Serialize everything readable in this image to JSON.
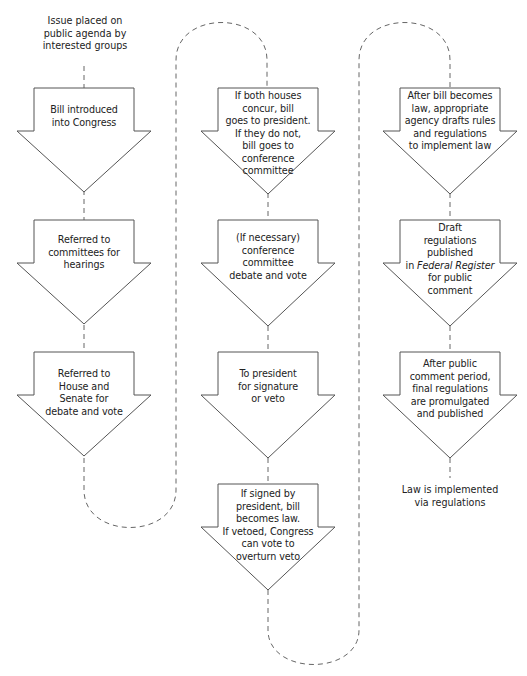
{
  "start_label": [
    "Issue placed on",
    "public agenda by",
    "interested groups"
  ],
  "end_label": [
    "Law is implemented",
    "via regulations"
  ],
  "columns": [
    {
      "steps": [
        {
          "lines": [
            "Bill introduced",
            "into Congress"
          ]
        },
        {
          "lines": [
            "Referred to",
            "committees for",
            "hearings"
          ]
        },
        {
          "lines": [
            "Referred to",
            "House and",
            "Senate for",
            "debate and vote"
          ]
        }
      ]
    },
    {
      "steps": [
        {
          "lines": [
            "If both houses",
            "concur, bill",
            "goes to president.",
            "If they do not,",
            "bill goes to",
            "conference",
            "committee"
          ]
        },
        {
          "lines": [
            "(If necessary)",
            "conference",
            "committee",
            "debate and vote"
          ]
        },
        {
          "lines": [
            "To president",
            "for signature",
            "or veto"
          ]
        },
        {
          "lines": [
            "If signed by",
            "president, bill",
            "becomes law.",
            "If vetoed, Congress",
            "can vote to",
            "overturn veto"
          ]
        }
      ]
    },
    {
      "steps": [
        {
          "lines": [
            "After bill becomes",
            "law, appropriate",
            "agency drafts rules",
            "and regulations",
            "to implement law"
          ]
        },
        {
          "lines": [
            "Draft",
            "regulations",
            "published",
            "in <em>Federal Register</em>",
            "for public",
            "comment"
          ]
        },
        {
          "lines": [
            "After public",
            "comment period,",
            "final regulations",
            "are promulgated",
            "and published"
          ]
        }
      ]
    }
  ],
  "colors": {
    "stroke": "#555555",
    "connector": "#666666",
    "text": "#222222",
    "background": "#ffffff"
  }
}
